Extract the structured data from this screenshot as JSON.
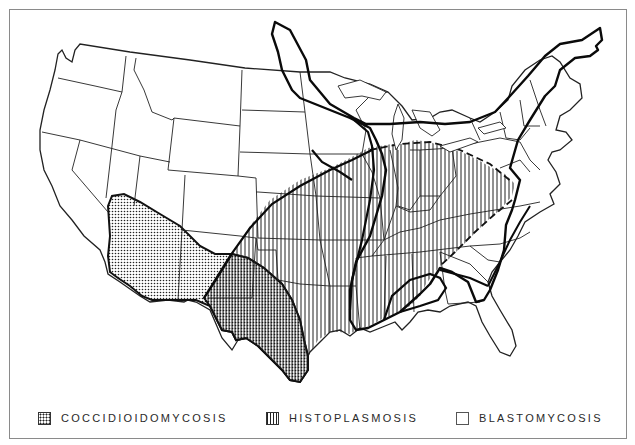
{
  "legend": {
    "items": [
      {
        "key": "coccidioidomycosis",
        "label": "COCCIDIOIDOMYCOSIS",
        "pattern": "stippled-dots"
      },
      {
        "key": "histoplasmosis",
        "label": "HISTOPLASMOSIS",
        "pattern": "vertical-lines"
      },
      {
        "key": "blastomycosis",
        "label": "BLASTOMYCOSIS",
        "pattern": "outline-only"
      }
    ]
  },
  "colors": {
    "ink": "#1a1a1a",
    "frame": "#8a8a8a",
    "background": "#ffffff"
  },
  "map_regions": [
    {
      "name": "coccidioidomycosis-region",
      "area": "Southwest: southern California, Arizona, southern Nevada/Utah, New Mexico, west & south Texas"
    },
    {
      "name": "histoplasmosis-region",
      "area": "Ohio and Mississippi River valleys: Kansas/Oklahoma east to Ohio, Kentucky, Tennessee, Arkansas, Louisiana, Mississippi, Alabama, Virginia/Maryland"
    },
    {
      "name": "blastomycosis-region",
      "area": "Great Lakes, Mississippi & Ohio valleys, St. Lawrence to New England, southeastern states"
    }
  ]
}
